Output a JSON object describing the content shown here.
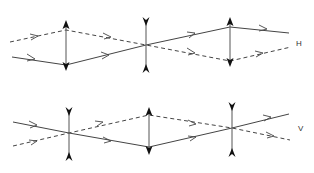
{
  "diagram": {
    "title": "",
    "planes": [
      {
        "label": "H",
        "lenses": [
          {
            "type": "converging",
            "x": 66,
            "top": 20,
            "bottom": 71
          },
          {
            "type": "diverging",
            "x": 146,
            "top": 17,
            "bottom": 73
          },
          {
            "type": "converging",
            "x": 230,
            "top": 17,
            "bottom": 67
          }
        ],
        "rays": [
          {
            "style": "dashed",
            "points": [
              [
                10,
                42
              ],
              [
                66,
                30
              ],
              [
                146,
                45
              ],
              [
                230,
                61
              ],
              [
                291,
                47
              ]
            ]
          },
          {
            "style": "solid",
            "points": [
              [
                12,
                57
              ],
              [
                66,
                65
              ],
              [
                146,
                45
              ],
              [
                230,
                27
              ],
              [
                289,
                33
              ]
            ]
          }
        ]
      },
      {
        "label": "V",
        "lenses": [
          {
            "type": "diverging",
            "x": 69,
            "top": 107,
            "bottom": 161
          },
          {
            "type": "converging",
            "x": 149,
            "top": 107,
            "bottom": 155
          },
          {
            "type": "diverging",
            "x": 232,
            "top": 102,
            "bottom": 157
          }
        ],
        "rays": [
          {
            "style": "solid",
            "points": [
              [
                13,
                122
              ],
              [
                69,
                133
              ],
              [
                149,
                147
              ],
              [
                232,
                128
              ],
              [
                289,
                114
              ]
            ]
          },
          {
            "style": "dashed",
            "points": [
              [
                13,
                146
              ],
              [
                69,
                133
              ],
              [
                149,
                115
              ],
              [
                232,
                128
              ],
              [
                290,
                140
              ]
            ]
          }
        ]
      }
    ]
  }
}
